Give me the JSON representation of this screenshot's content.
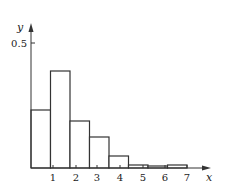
{
  "chart_data": {
    "type": "bar",
    "subtype": "histogram",
    "title": "",
    "xlabel": "x",
    "ylabel": "y",
    "bin_edges": [
      0,
      0.875,
      1.75,
      2.625,
      3.5,
      4.375,
      5.25,
      6.125,
      7.0
    ],
    "values": [
      0.232,
      0.388,
      0.188,
      0.124,
      0.048,
      0.012,
      0.008,
      0.012
    ],
    "x_ticks": [
      1,
      2,
      3,
      4,
      5,
      6,
      7
    ],
    "x_tick_labels": [
      "1",
      "2",
      "3",
      "4",
      "5",
      "6",
      "7"
    ],
    "y_ticks": [
      0.5
    ],
    "y_tick_labels": [
      "0.5"
    ],
    "xlim": [
      0,
      8
    ],
    "ylim": [
      0,
      0.55
    ],
    "grid": false,
    "legend": null,
    "bar_fill": "#ffffff",
    "bar_stroke": "#333333"
  }
}
